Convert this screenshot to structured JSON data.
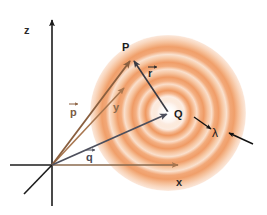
{
  "figure": {
    "background_color": "#ffffff"
  },
  "axes": {
    "z": {
      "label": "z",
      "x": 28,
      "y": 31,
      "tip_x": 52,
      "tip_y": 14,
      "origin_x": 52,
      "origin_y": 165,
      "neg_x": 52,
      "neg_y": 206,
      "color": "#1c1c1c"
    },
    "x": {
      "label": "x",
      "x": 178,
      "y": 184,
      "tip_x": 184,
      "tip_y": 165,
      "origin_x": 52,
      "origin_y": 165,
      "neg_x": 10,
      "neg_y": 165,
      "color": "#8a6a4e"
    },
    "y": {
      "label": "y",
      "x": 114,
      "y": 110,
      "tip_x": 129,
      "tip_y": 83,
      "origin_x": 52,
      "origin_y": 165,
      "neg_x": 24,
      "neg_y": 194,
      "color": "#a8764f"
    }
  },
  "vectors": [
    {
      "name": "p-vector",
      "label": "p",
      "label_x": 74,
      "label_y": 113,
      "color": "#8a5f3f",
      "from_x": 52,
      "from_y": 165,
      "to_x": 132,
      "to_y": 58,
      "arrow_accent": true
    },
    {
      "name": "q-vector",
      "label": "q",
      "label_x": 90,
      "label_y": 158,
      "color": "#4d4f5c",
      "from_x": 52,
      "from_y": 165,
      "to_x": 170,
      "to_y": 113,
      "arrow_accent": true
    },
    {
      "name": "r-vector",
      "label": "r",
      "label_x": 151,
      "label_y": 74,
      "color": "#3a3a42",
      "from_x": 168,
      "from_y": 112,
      "to_x": 133,
      "to_y": 59,
      "arrow_accent": true
    }
  ],
  "points": [
    {
      "name": "point-P",
      "label": "P",
      "x": 126,
      "y": 48,
      "marker_x": 133,
      "marker_y": 58
    },
    {
      "name": "source-charge-Q",
      "label": "Q",
      "x": 176,
      "y": 117,
      "marker_x": 168,
      "marker_y": 113
    }
  ],
  "wavelength_indicator": {
    "label": "λ",
    "label_x": 216,
    "label_y": 136,
    "color": "#1c1c1c",
    "left_arrow": {
      "from_x": 194,
      "from_y": 117,
      "to_x": 212,
      "to_y": 129
    },
    "right_arrow": {
      "from_x": 252,
      "from_y": 143,
      "to_x": 228,
      "to_y": 133
    }
  },
  "wavefront": {
    "name": "concentric-wave-rings",
    "center_x": 168,
    "center_y": 113,
    "outer_radius": 78,
    "core_color": "#ffffff",
    "band_colors": [
      "#f5b98c",
      "#f7cba8",
      "#f3a877",
      "#f9d2b4",
      "#ef9a63",
      "#fadcc4",
      "#f4b489",
      "#fbe3d1"
    ],
    "ring_radii": [
      10,
      17,
      24,
      31,
      38,
      46,
      54,
      62,
      70,
      78
    ]
  }
}
